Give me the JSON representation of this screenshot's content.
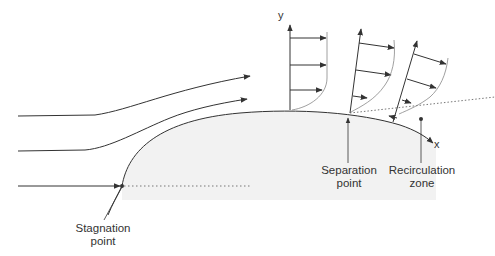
{
  "diagram": {
    "type": "flow-separation-schematic",
    "colors": {
      "line": "#333333",
      "body_fill": "#f2f2f2",
      "dotted": "#777777",
      "text": "#333333"
    },
    "axes": {
      "y_label": "y",
      "x_label": "x"
    },
    "labels": {
      "stagnation": {
        "line1": "Stagnation",
        "line2": "point"
      },
      "separation": {
        "line1": "Separation",
        "line2": "point"
      },
      "recirculation": {
        "line1": "Recirculation",
        "line2": "zone"
      }
    },
    "streamlines": [
      {
        "name": "upper",
        "start_y": 116
      },
      {
        "name": "middle",
        "start_y": 151
      },
      {
        "name": "stagnation",
        "start_y": 186
      }
    ],
    "velocity_profiles": [
      {
        "name": "attached",
        "arrows": 3
      },
      {
        "name": "near-separation",
        "arrows": 3
      },
      {
        "name": "reversed",
        "arrows": 4
      }
    ]
  }
}
